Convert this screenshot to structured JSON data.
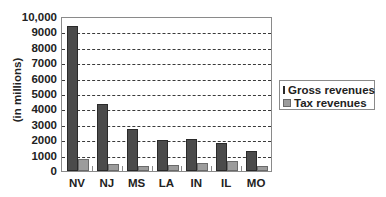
{
  "chart_data": {
    "type": "bar",
    "title": "",
    "xlabel": "",
    "ylabel": "(in millions)",
    "ylim": [
      0,
      10000
    ],
    "yticks": [
      "0",
      "1000",
      "2000",
      "3000",
      "4000",
      "5000",
      "6000",
      "7000",
      "8000",
      "9000",
      "10,000"
    ],
    "ytick_values": [
      0,
      1000,
      2000,
      3000,
      4000,
      5000,
      6000,
      7000,
      8000,
      9000,
      10000
    ],
    "grid": "horizontal dashed",
    "legend_position": "right",
    "categories": [
      "NV",
      "NJ",
      "MS",
      "LA",
      "IN",
      "IL",
      "MO"
    ],
    "series": [
      {
        "name": "Gross revenues",
        "color": "#4b4b4b",
        "values": [
          9400,
          4350,
          2700,
          2000,
          2100,
          1800,
          1300
        ]
      },
      {
        "name": "Tax revenues",
        "color": "#9c9c9c",
        "values": [
          750,
          450,
          350,
          400,
          550,
          650,
          350
        ]
      }
    ]
  }
}
